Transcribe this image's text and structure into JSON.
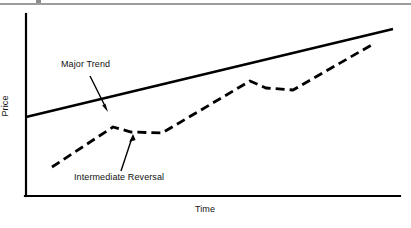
{
  "figure": {
    "background_color": "#ffffff",
    "ink_color": "#000000",
    "top_rule": {
      "y": 4,
      "x1": 0,
      "x2": 411,
      "visible": true
    }
  },
  "axes": {
    "y_axis_label": "Price",
    "x_axis_label": "Time",
    "origin": {
      "x": 26,
      "y": 196
    },
    "y_axis_top": {
      "x": 26,
      "y": 14
    },
    "x_axis_right": {
      "x": 400,
      "y": 196
    }
  },
  "annotations": [
    {
      "name": "major-trend",
      "label": "Major Trend",
      "text_x": 61,
      "text_y": 59,
      "arrow_from": {
        "x": 90,
        "y": 76
      },
      "arrow_to": {
        "x": 108,
        "y": 111
      }
    },
    {
      "name": "intermediate-reversal",
      "label": "Intermediate Reversal",
      "text_x": 74,
      "text_y": 172,
      "arrow_from": {
        "x": 121,
        "y": 171
      },
      "arrow_to": {
        "x": 133,
        "y": 134
      }
    }
  ],
  "chart_data": {
    "type": "line",
    "title": "",
    "subtitle": "",
    "xlabel": "Time",
    "ylabel": "Price",
    "grid": false,
    "legend": false,
    "axis_ticks": false,
    "xlim": [
      0,
      100
    ],
    "ylim": [
      0,
      100
    ],
    "series": [
      {
        "name": "Major Trend",
        "style": "solid",
        "linewidth": 2.4,
        "color": "#000000",
        "points_px": [
          {
            "x": 26,
            "y": 117
          },
          {
            "x": 393,
            "y": 29
          }
        ],
        "x": [
          0,
          100
        ],
        "values": [
          43,
          92
        ]
      },
      {
        "name": "Intermediate Reversal",
        "style": "dashed",
        "linewidth": 2.8,
        "dash": "9 5",
        "color": "#000000",
        "points_px": [
          {
            "x": 52,
            "y": 167
          },
          {
            "x": 113,
            "y": 127
          },
          {
            "x": 131,
            "y": 132
          },
          {
            "x": 162,
            "y": 133
          },
          {
            "x": 250,
            "y": 81
          },
          {
            "x": 266,
            "y": 88
          },
          {
            "x": 293,
            "y": 90
          },
          {
            "x": 375,
            "y": 43
          }
        ],
        "x": [
          7,
          23,
          28,
          36,
          60,
          64,
          71,
          93
        ],
        "values": [
          16,
          38,
          35,
          35,
          64,
          60,
          59,
          85
        ]
      }
    ]
  }
}
